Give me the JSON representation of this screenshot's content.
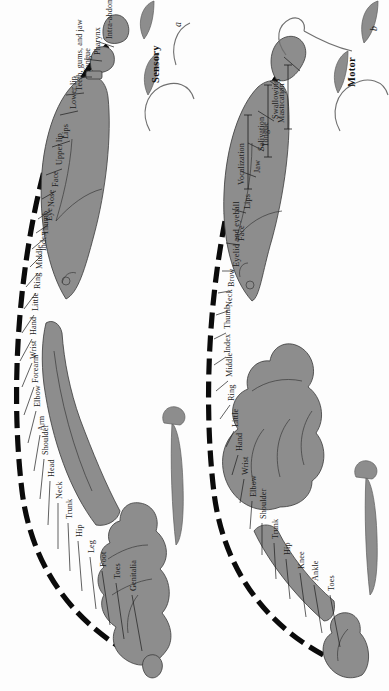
{
  "figure": {
    "orientation": "page rotated 90 degrees clockwise; labels read bottom-to-top",
    "background_color": "#fdfdfd",
    "body_fill_color": "#8d8d8d",
    "outline_color": "#3a3a3a",
    "arc_color": "#0b0b0b"
  },
  "panels": [
    {
      "id": "sensory",
      "letter": "a",
      "title": "Sensory",
      "labels": [
        {
          "text": "Genitalia"
        },
        {
          "text": "Toes"
        },
        {
          "text": "Foot"
        },
        {
          "text": "Leg"
        },
        {
          "text": "Hip"
        },
        {
          "text": "Trunk"
        },
        {
          "text": "Neck"
        },
        {
          "text": "Head"
        },
        {
          "text": "Shoulder"
        },
        {
          "text": "Arm"
        },
        {
          "text": "Elbow"
        },
        {
          "text": "Forearm"
        },
        {
          "text": "Wrist"
        },
        {
          "text": "Hand"
        },
        {
          "text": "Little"
        },
        {
          "text": "Ring"
        },
        {
          "text": "Middle"
        },
        {
          "text": "Index"
        },
        {
          "text": "Thumb"
        },
        {
          "text": "Eye"
        },
        {
          "text": "Nose"
        },
        {
          "text": "Face"
        },
        {
          "text": "Upper lip"
        },
        {
          "text": "Lips"
        },
        {
          "text": "Lower lip"
        },
        {
          "text": "Teeth, gums, and jaw"
        },
        {
          "text": "Tongue"
        },
        {
          "text": "Pharynx"
        },
        {
          "text": "Intra-abdominal"
        }
      ]
    },
    {
      "id": "motor",
      "letter": "b",
      "title": "Motor",
      "labels": [
        {
          "text": "Toes"
        },
        {
          "text": "Ankle"
        },
        {
          "text": "Knee"
        },
        {
          "text": "Hip"
        },
        {
          "text": "Trunk"
        },
        {
          "text": "Shoulder"
        },
        {
          "text": "Elbow"
        },
        {
          "text": "Wrist"
        },
        {
          "text": "Hand"
        },
        {
          "text": "Little"
        },
        {
          "text": "Ring"
        },
        {
          "text": "Middle"
        },
        {
          "text": "Index"
        },
        {
          "text": "Thumb"
        },
        {
          "text": "Neck"
        },
        {
          "text": "Brow"
        },
        {
          "text": "Eyelid and eyeball"
        },
        {
          "text": "Face"
        },
        {
          "text": "Lips"
        },
        {
          "text": "Jaw"
        },
        {
          "text": "Tongue"
        },
        {
          "text": "Swallowing"
        },
        {
          "text": "Vocalization"
        },
        {
          "text": "Salivation"
        },
        {
          "text": "Mastication"
        }
      ]
    }
  ]
}
